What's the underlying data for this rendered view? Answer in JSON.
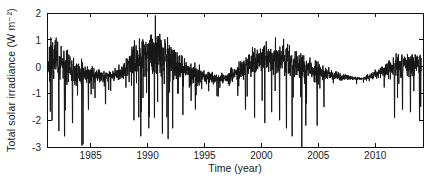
{
  "figure": {
    "colors": {
      "background": "#ffffff",
      "axis": "#111111",
      "series_line": "#161616",
      "text": "#1a1a1a"
    }
  },
  "chart_data": {
    "type": "line",
    "title": "",
    "xlabel": "Time (year)",
    "ylabel": "Total solar irradiance (W m⁻²)",
    "xlim": [
      1981.2,
      2014.2
    ],
    "ylim": [
      -3,
      2
    ],
    "xticks": [
      1985,
      1990,
      1995,
      2000,
      2005,
      2010
    ],
    "yticks": [
      2,
      1,
      0,
      -1,
      -2,
      -3
    ],
    "grid": false,
    "legend_position": "none",
    "series_name": "daily total solar irradiance anomaly",
    "data_start": 1981.25,
    "data_end": 2014.05,
    "samples_per_year": 70,
    "noise_seed": 7,
    "envelope": [
      {
        "year": 1981.2,
        "center": 0.15,
        "spread": 0.95
      },
      {
        "year": 1982.0,
        "center": 0.25,
        "spread": 1.05
      },
      {
        "year": 1982.8,
        "center": 0.05,
        "spread": 0.85
      },
      {
        "year": 1983.6,
        "center": -0.25,
        "spread": 0.55
      },
      {
        "year": 1984.5,
        "center": -0.3,
        "spread": 0.45
      },
      {
        "year": 1985.5,
        "center": -0.3,
        "spread": 0.35
      },
      {
        "year": 1986.5,
        "center": -0.35,
        "spread": 0.28
      },
      {
        "year": 1987.3,
        "center": -0.3,
        "spread": 0.3
      },
      {
        "year": 1988.2,
        "center": -0.1,
        "spread": 0.5
      },
      {
        "year": 1989.0,
        "center": 0.35,
        "spread": 0.9
      },
      {
        "year": 1990.0,
        "center": 0.55,
        "spread": 1.05
      },
      {
        "year": 1991.0,
        "center": 0.5,
        "spread": 1.1
      },
      {
        "year": 1992.0,
        "center": 0.3,
        "spread": 0.9
      },
      {
        "year": 1993.0,
        "center": -0.05,
        "spread": 0.6
      },
      {
        "year": 1994.0,
        "center": -0.25,
        "spread": 0.45
      },
      {
        "year": 1995.0,
        "center": -0.35,
        "spread": 0.32
      },
      {
        "year": 1996.0,
        "center": -0.45,
        "spread": 0.25
      },
      {
        "year": 1997.0,
        "center": -0.4,
        "spread": 0.22
      },
      {
        "year": 1998.0,
        "center": -0.15,
        "spread": 0.4
      },
      {
        "year": 1999.0,
        "center": 0.1,
        "spread": 0.55
      },
      {
        "year": 2000.0,
        "center": 0.3,
        "spread": 0.7
      },
      {
        "year": 2001.0,
        "center": 0.35,
        "spread": 0.75
      },
      {
        "year": 2002.0,
        "center": 0.4,
        "spread": 0.75
      },
      {
        "year": 2003.0,
        "center": 0.1,
        "spread": 0.65
      },
      {
        "year": 2004.0,
        "center": -0.1,
        "spread": 0.5
      },
      {
        "year": 2005.0,
        "center": -0.2,
        "spread": 0.45
      },
      {
        "year": 2006.0,
        "center": -0.3,
        "spread": 0.3
      },
      {
        "year": 2007.0,
        "center": -0.38,
        "spread": 0.18
      },
      {
        "year": 2008.0,
        "center": -0.42,
        "spread": 0.1
      },
      {
        "year": 2009.0,
        "center": -0.45,
        "spread": 0.08
      },
      {
        "year": 2010.0,
        "center": -0.3,
        "spread": 0.2
      },
      {
        "year": 2011.0,
        "center": -0.1,
        "spread": 0.4
      },
      {
        "year": 2012.0,
        "center": 0.05,
        "spread": 0.5
      },
      {
        "year": 2013.0,
        "center": 0.1,
        "spread": 0.55
      },
      {
        "year": 2014.2,
        "center": 0.15,
        "spread": 0.55
      }
    ],
    "spikes": [
      {
        "year": 1981.6,
        "value": -2.0
      },
      {
        "year": 1982.2,
        "value": -2.4
      },
      {
        "year": 1982.7,
        "value": -2.6
      },
      {
        "year": 1983.4,
        "value": -2.1
      },
      {
        "year": 1984.22,
        "value": -2.95
      },
      {
        "year": 1984.32,
        "value": -2.9
      },
      {
        "year": 1984.8,
        "value": -1.6
      },
      {
        "year": 1986.3,
        "value": -1.4
      },
      {
        "year": 1988.8,
        "value": -2.0
      },
      {
        "year": 1989.4,
        "value": -2.6
      },
      {
        "year": 1990.1,
        "value": -2.3
      },
      {
        "year": 1990.6,
        "value": -1.9
      },
      {
        "year": 1991.3,
        "value": -2.5
      },
      {
        "year": 1991.8,
        "value": -2.7
      },
      {
        "year": 1992.2,
        "value": -2.3
      },
      {
        "year": 1993.1,
        "value": -1.8
      },
      {
        "year": 1994.2,
        "value": -1.6
      },
      {
        "year": 1996.1,
        "value": -1.1
      },
      {
        "year": 1998.6,
        "value": -1.6
      },
      {
        "year": 1999.4,
        "value": -1.9
      },
      {
        "year": 2000.3,
        "value": -2.1
      },
      {
        "year": 2000.9,
        "value": -1.7
      },
      {
        "year": 2001.6,
        "value": -2.0
      },
      {
        "year": 2002.2,
        "value": -2.3
      },
      {
        "year": 2002.7,
        "value": -2.6
      },
      {
        "year": 2003.55,
        "value": -3.0
      },
      {
        "year": 2003.9,
        "value": -2.2
      },
      {
        "year": 2004.9,
        "value": -2.2
      },
      {
        "year": 2005.5,
        "value": -1.5
      },
      {
        "year": 2011.7,
        "value": -1.9
      },
      {
        "year": 2012.4,
        "value": -1.6
      },
      {
        "year": 2013.1,
        "value": -1.7
      },
      {
        "year": 2013.9,
        "value": -2.0
      },
      {
        "year": 2014.0,
        "value": -1.5
      }
    ]
  }
}
